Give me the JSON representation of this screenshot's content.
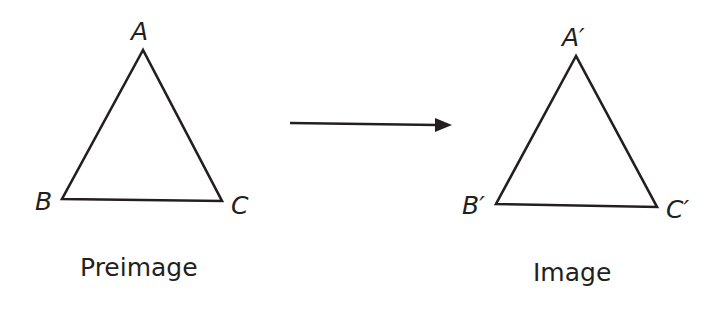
{
  "diagram": {
    "type": "geometric-transformation",
    "colors": {
      "stroke": "#231f20",
      "background": "#ffffff"
    },
    "preimage": {
      "caption": "Preimage",
      "vertices": [
        {
          "label": "A",
          "x": 143,
          "y": 50
        },
        {
          "label": "B",
          "x": 62,
          "y": 199
        },
        {
          "label": "C",
          "x": 222,
          "y": 201
        }
      ]
    },
    "image": {
      "caption": "Image",
      "vertices": [
        {
          "label": "A′",
          "x": 576,
          "y": 56
        },
        {
          "label": "B′",
          "x": 496,
          "y": 204
        },
        {
          "label": "C′",
          "x": 657,
          "y": 207
        }
      ]
    },
    "arrow": {
      "from": [
        290,
        123
      ],
      "to": [
        451,
        125
      ],
      "direction": "right"
    }
  }
}
